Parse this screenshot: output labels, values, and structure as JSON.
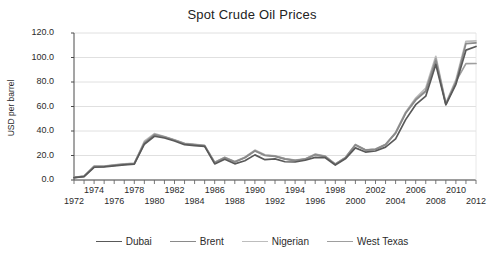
{
  "chart_data": {
    "type": "line",
    "title": "Spot Crude Oil Prices",
    "xlabel": "",
    "ylabel": "USD per barrel",
    "ylim": [
      0,
      120
    ],
    "yticks": [
      "0.0",
      "20.0",
      "40.0",
      "60.0",
      "80.0",
      "100.0",
      "120.0"
    ],
    "ytick_values": [
      0,
      20,
      40,
      60,
      80,
      100,
      120
    ],
    "xlim": [
      1972,
      2012
    ],
    "xticks": [
      "1972",
      "1974",
      "1976",
      "1978",
      "1980",
      "1982",
      "1984",
      "1986",
      "1988",
      "1990",
      "1992",
      "1994",
      "1996",
      "1998",
      "2000",
      "2002",
      "2004",
      "2006",
      "2008",
      "2010",
      "2012"
    ],
    "xticks_top_row": [
      "1974",
      "1978",
      "1982",
      "1986",
      "1990",
      "1994",
      "1998",
      "2002",
      "2006",
      "2010"
    ],
    "xticks_bottom_row": [
      "1972",
      "1976",
      "1980",
      "1984",
      "1988",
      "1992",
      "1996",
      "2000",
      "2004",
      "2008",
      "2012"
    ],
    "grid": true,
    "grid_axis": "y",
    "legend_position": "bottom",
    "x": [
      1972,
      1973,
      1974,
      1975,
      1976,
      1977,
      1978,
      1979,
      1980,
      1981,
      1982,
      1983,
      1984,
      1985,
      1986,
      1987,
      1988,
      1989,
      1990,
      1991,
      1992,
      1993,
      1994,
      1995,
      1996,
      1997,
      1998,
      1999,
      2000,
      2001,
      2002,
      2003,
      2004,
      2005,
      2006,
      2007,
      2008,
      2009,
      2010,
      2011,
      2012
    ],
    "series": [
      {
        "name": "Dubai",
        "color": "#595959",
        "values": [
          1.9,
          2.8,
          10.4,
          10.7,
          11.6,
          12.4,
          13.0,
          29.2,
          35.7,
          34.3,
          31.8,
          28.8,
          28.1,
          27.5,
          13.1,
          16.9,
          13.2,
          15.7,
          20.5,
          16.6,
          17.2,
          14.9,
          14.7,
          16.1,
          18.5,
          18.2,
          12.2,
          17.3,
          26.2,
          22.8,
          23.7,
          26.8,
          33.6,
          49.3,
          61.5,
          68.4,
          94.3,
          61.4,
          78.1,
          106.0,
          109.0
        ]
      },
      {
        "name": "Brent",
        "color": "#8a8a8a",
        "values": [
          2.0,
          3.0,
          10.9,
          11.0,
          12.0,
          12.8,
          13.4,
          30.0,
          36.8,
          35.0,
          32.4,
          29.5,
          28.7,
          27.8,
          14.0,
          18.2,
          14.7,
          18.2,
          23.7,
          20.0,
          19.3,
          17.0,
          15.8,
          17.0,
          20.6,
          19.1,
          12.8,
          17.9,
          28.5,
          24.4,
          25.0,
          28.8,
          38.3,
          54.4,
          65.2,
          72.4,
          97.3,
          61.7,
          79.6,
          111.3,
          112.0
        ]
      },
      {
        "name": "Nigerian",
        "color": "#bdbdbd",
        "values": [
          2.1,
          3.2,
          11.3,
          11.3,
          12.4,
          13.1,
          13.6,
          31.6,
          37.9,
          35.5,
          32.8,
          29.9,
          29.1,
          28.3,
          14.5,
          18.5,
          15.0,
          18.6,
          24.4,
          20.5,
          19.8,
          17.4,
          16.2,
          17.2,
          21.2,
          19.5,
          13.1,
          18.3,
          29.0,
          24.6,
          25.3,
          29.2,
          38.8,
          55.4,
          66.9,
          75.1,
          101.0,
          62.5,
          81.7,
          113.2,
          113.5
        ]
      },
      {
        "name": "West Texas",
        "color": "#9e9e9e",
        "values": [
          2.0,
          3.1,
          11.1,
          11.2,
          12.2,
          13.0,
          13.5,
          30.6,
          37.2,
          35.2,
          32.6,
          29.7,
          28.9,
          28.0,
          14.2,
          18.3,
          14.9,
          18.4,
          24.0,
          20.2,
          19.5,
          17.2,
          16.0,
          17.1,
          20.9,
          19.3,
          12.9,
          18.1,
          28.8,
          24.5,
          25.1,
          29.0,
          38.5,
          54.9,
          66.0,
          73.0,
          99.0,
          62.0,
          80.5,
          95.0,
          95.1
        ]
      }
    ]
  }
}
